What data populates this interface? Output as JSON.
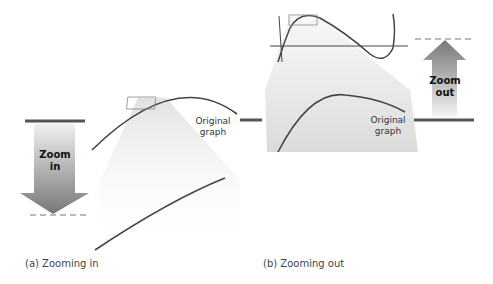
{
  "panel_a": {
    "arrow_label_line1": "Zoom",
    "arrow_label_line2": "in",
    "graph_label_line1": "Original",
    "graph_label_line2": "graph",
    "caption": "(a) Zooming in"
  },
  "panel_b": {
    "arrow_label_line1": "Zoom",
    "arrow_label_line2": "out",
    "graph_label_line1": "Original",
    "graph_label_line2": "graph",
    "caption": "(b) Zooming out"
  },
  "colors": {
    "curve": "#444444",
    "arrow_dark": "#7a7a7a",
    "arrow_light": "#f2f2f2",
    "beam": "#d9d9d9"
  }
}
